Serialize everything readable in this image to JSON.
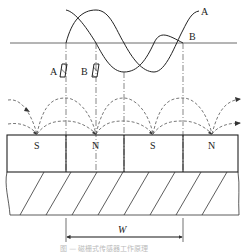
{
  "diagram": {
    "type": "magnetic-grating-sensor-principle",
    "signals": [
      {
        "label": "A",
        "shape": "sine",
        "description": "signal curve A"
      },
      {
        "label": "B",
        "shape": "sine-shifted",
        "description": "signal curve B (90° phase shift)"
      }
    ],
    "heads": [
      {
        "label": "A"
      },
      {
        "label": "B"
      }
    ],
    "poles": [
      "S",
      "N",
      "S",
      "N"
    ],
    "dimension": {
      "label": "W"
    },
    "caption": "图 — 磁栅式传感器工作原理",
    "colors": {
      "line": "#222222",
      "dashed": "#555555",
      "hatch": "#444444",
      "caption": "#bbbbbb"
    }
  }
}
